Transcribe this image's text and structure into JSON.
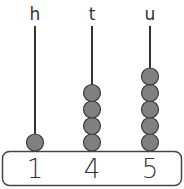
{
  "diagram": {
    "type": "abacus",
    "columns": [
      {
        "label": "h",
        "beads": 1,
        "digit": "1",
        "x": 35
      },
      {
        "label": "t",
        "beads": 4,
        "digit": "4",
        "x": 92
      },
      {
        "label": "u",
        "beads": 5,
        "digit": "5",
        "x": 150
      }
    ],
    "colors": {
      "bead_fill": "#808080",
      "bead_stroke": "#3a3a3a",
      "rod": "#333333",
      "base_stroke": "#444444"
    }
  }
}
